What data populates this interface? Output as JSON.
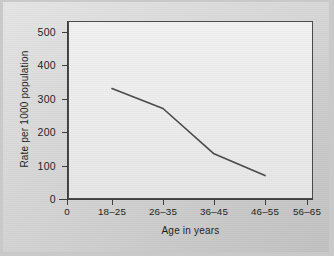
{
  "chart_data": {
    "type": "line",
    "title": "",
    "subtitle": "",
    "xlabel": "Age in years",
    "ylabel": "Rate per 1000 population",
    "categories": [
      "0",
      "18–25",
      "26–35",
      "36–45",
      "46–55",
      "56–65"
    ],
    "x_tick_labels": [
      "0",
      "18–25",
      "26–35",
      "36–45",
      "46–55",
      "56–65"
    ],
    "y_tick_labels": [
      "0",
      "100",
      "200",
      "300",
      "400",
      "500"
    ],
    "y_ticks": [
      0,
      100,
      200,
      300,
      400,
      500
    ],
    "ylim": [
      0,
      530
    ],
    "grid": false,
    "legend": false,
    "legend_position": "none",
    "series": [
      {
        "name": "Rate per 1000 population",
        "color": "#4a4a4a",
        "x": [
          "18–25",
          "26–35",
          "36–45",
          "46–55"
        ],
        "values": [
          330,
          270,
          135,
          70
        ]
      }
    ],
    "annotations": []
  },
  "figure": {
    "page_background": "#d2d2d2",
    "plot_background": "#ececec",
    "axis_color": "#3e3e3e",
    "line_color": "#4a4a4a",
    "text_color": "#1f1f1f"
  }
}
